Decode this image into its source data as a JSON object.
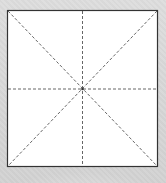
{
  "diagram": {
    "square": {
      "x": 7,
      "y": 10,
      "width": 151,
      "height": 157
    },
    "center": {
      "x": 82,
      "y": 89
    },
    "fold_lines": [
      {
        "name": "diagonal-tl-br",
        "style": "dashed"
      },
      {
        "name": "diagonal-tr-bl",
        "style": "dashed"
      },
      {
        "name": "vertical-midline",
        "style": "dashed"
      },
      {
        "name": "horizontal-midline",
        "style": "dashed"
      }
    ],
    "colors": {
      "background": "#d9d9d9",
      "square_fill": "#ffffff",
      "border": "#333333",
      "dashed_line": "#555555"
    }
  }
}
